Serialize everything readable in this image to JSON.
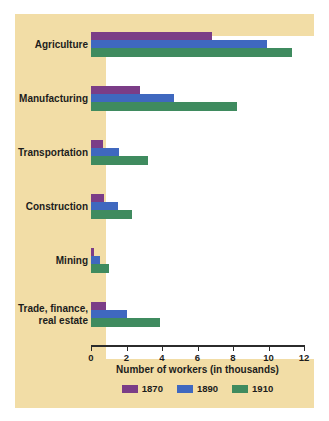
{
  "chart_data": {
    "type": "bar",
    "orientation": "horizontal",
    "title": "",
    "xlabel": "Number of workers (in thousands)",
    "ylabel": "",
    "xlim": [
      0,
      12
    ],
    "xticks": [
      0,
      2,
      4,
      6,
      8,
      10,
      12
    ],
    "grid": false,
    "legend_position": "bottom",
    "categories": [
      "Agriculture",
      "Manufacturing",
      "Transportation",
      "Construction",
      "Mining",
      "Trade, finance,\nreal estate"
    ],
    "series": [
      {
        "name": "1870",
        "color": "#7b3d87",
        "values": [
          6.8,
          2.75,
          0.65,
          0.75,
          0.15,
          0.85
        ]
      },
      {
        "name": "1890",
        "color": "#3f68bf",
        "values": [
          9.9,
          4.7,
          1.55,
          1.5,
          0.5,
          2.0
        ]
      },
      {
        "name": "1910",
        "color": "#3f8b5f",
        "values": [
          11.35,
          8.2,
          3.2,
          2.3,
          1.0,
          3.9
        ]
      }
    ]
  },
  "colors": {
    "page_background": "#ffffff",
    "panel_background": "#f2dda6",
    "plot_background": "#ffffff",
    "axis": "#2b2b2b",
    "text": "#1c1c1c"
  }
}
